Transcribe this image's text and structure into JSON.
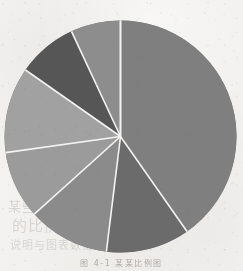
{
  "figure": {
    "caption": "图 4-1  某某比例图",
    "background_color": "#f2f1ee"
  },
  "chart_data": {
    "type": "pie",
    "title": "",
    "subtitle": "",
    "xlabel": "",
    "ylabel": "",
    "legend": "none",
    "grid": false,
    "start_angle_deg": 0,
    "direction": "clockwise",
    "center": {
      "cx": 120.5,
      "cy": 136.5,
      "r": 116
    },
    "separator_color": "#f4f3f1",
    "separator_width": 1.6,
    "categories": [
      "Slice 1",
      "Slice 2",
      "Slice 3",
      "Slice 4",
      "Slice 5",
      "Slice 6",
      "Slice 7"
    ],
    "values": [
      40.3,
      11.7,
      11.4,
      9.4,
      12.0,
      8.3,
      6.9
    ],
    "angles_deg": [
      145.0,
      42.0,
      41.0,
      34.0,
      43.0,
      30.0,
      25.0
    ],
    "colors": [
      "#7f7f7f",
      "#6b6b6b",
      "#8b8b8b",
      "#9b9b9b",
      "#a1a1a1",
      "#565656",
      "#8d8d8d"
    ],
    "slices": [
      {
        "label": "Slice 1",
        "value": 40.3,
        "start_deg": 0.0,
        "end_deg": 145.0,
        "color": "#7f7f7f"
      },
      {
        "label": "Slice 2",
        "value": 11.7,
        "start_deg": 145.0,
        "end_deg": 187.0,
        "color": "#6b6b6b"
      },
      {
        "label": "Slice 3",
        "value": 11.4,
        "start_deg": 187.0,
        "end_deg": 228.0,
        "color": "#8b8b8b"
      },
      {
        "label": "Slice 4",
        "value": 9.4,
        "start_deg": 228.0,
        "end_deg": 262.0,
        "color": "#9b9b9b"
      },
      {
        "label": "Slice 5",
        "value": 12.0,
        "start_deg": 262.0,
        "end_deg": 305.0,
        "color": "#a1a1a1"
      },
      {
        "label": "Slice 6",
        "value": 8.3,
        "start_deg": 305.0,
        "end_deg": 335.0,
        "color": "#565656"
      },
      {
        "label": "Slice 7",
        "value": 6.9,
        "start_deg": 335.0,
        "end_deg": 360.0,
        "color": "#8d8d8d"
      }
    ]
  },
  "bleed_through": [
    {
      "text": "某些文字",
      "x": 8,
      "y": 196,
      "size": 13
    },
    {
      "text": "的比例",
      "x": 12,
      "y": 214,
      "size": 15
    },
    {
      "text": "说明与图表数据对照",
      "x": 10,
      "y": 236,
      "size": 11
    },
    {
      "text": "参考",
      "x": 186,
      "y": 200,
      "size": 11
    }
  ]
}
